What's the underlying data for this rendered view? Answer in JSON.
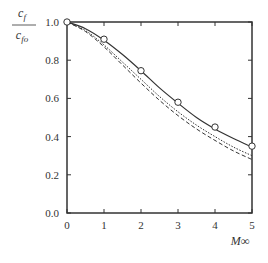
{
  "chart_data": {
    "type": "line",
    "title": "",
    "xlabel": "M∞",
    "ylabel": "cf / cfo",
    "ylabel_num": "c",
    "ylabel_num_sub": "f",
    "ylabel_den": "c",
    "ylabel_den_sub": "fo",
    "xlim": [
      0,
      5
    ],
    "ylim": [
      0.0,
      1.0
    ],
    "x_ticks": [
      "0",
      "1",
      "2",
      "3",
      "4",
      "5"
    ],
    "y_ticks": [
      "0.0",
      "0.2",
      "0.4",
      "0.6",
      "0.8",
      "1.0"
    ],
    "grid": false,
    "legend": "none",
    "series": [
      {
        "name": "solid curve",
        "style": "solid",
        "x": [
          0,
          0.5,
          1,
          1.5,
          2,
          2.5,
          3,
          3.5,
          4,
          4.5,
          5
        ],
        "values": [
          1.0,
          0.965,
          0.905,
          0.83,
          0.745,
          0.655,
          0.575,
          0.5,
          0.44,
          0.39,
          0.345
        ]
      },
      {
        "name": "dotted curve",
        "style": "dotted",
        "x": [
          0,
          0.5,
          1,
          1.5,
          2,
          2.5,
          3,
          3.5,
          4,
          4.5,
          5
        ],
        "values": [
          1.0,
          0.955,
          0.88,
          0.79,
          0.7,
          0.61,
          0.53,
          0.46,
          0.4,
          0.345,
          0.3
        ]
      },
      {
        "name": "dashed curve",
        "style": "dashed",
        "x": [
          0,
          0.5,
          1,
          1.5,
          2,
          2.5,
          3,
          3.5,
          4,
          4.5,
          5
        ],
        "values": [
          1.0,
          0.95,
          0.87,
          0.775,
          0.68,
          0.59,
          0.51,
          0.44,
          0.38,
          0.325,
          0.28
        ]
      },
      {
        "name": "data points",
        "style": "circle-markers",
        "x": [
          0,
          1,
          2,
          3,
          4,
          5
        ],
        "values": [
          1.0,
          0.91,
          0.745,
          0.58,
          0.45,
          0.35
        ]
      }
    ]
  }
}
